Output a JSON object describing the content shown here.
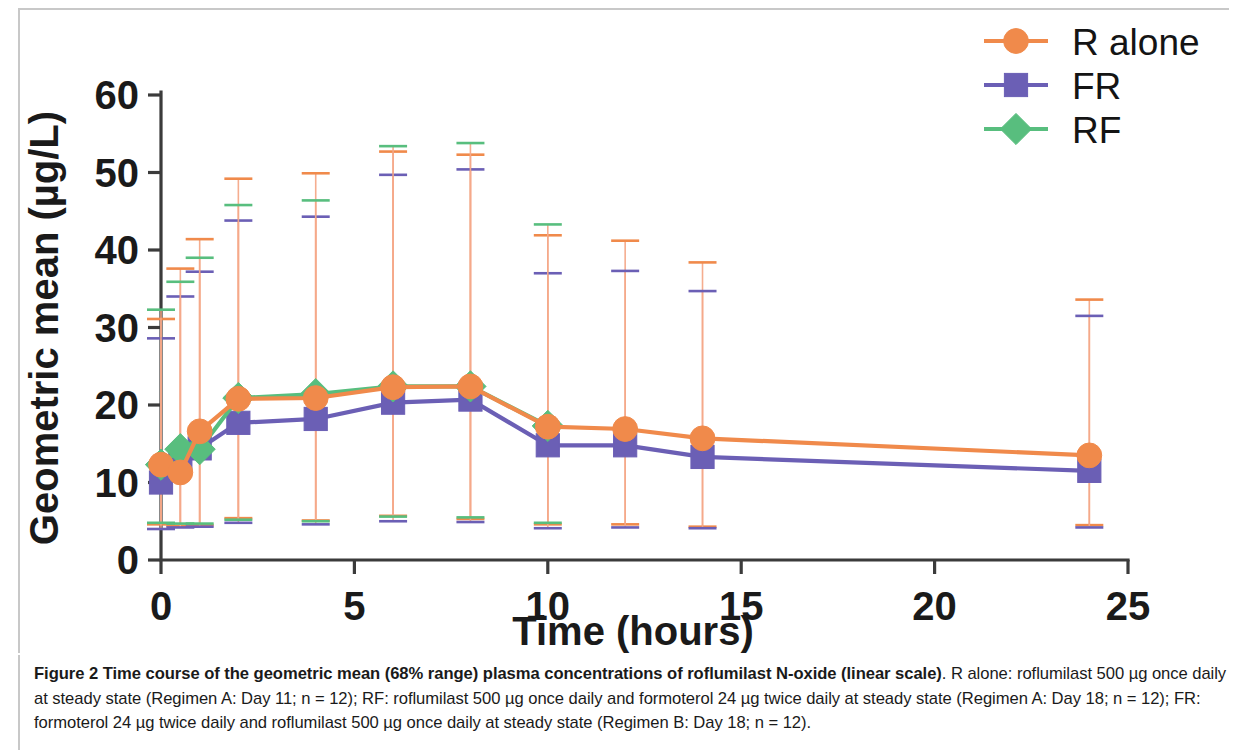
{
  "figure": {
    "caption_bold": "Figure 2 Time course of the geometric mean (68% range) plasma concentrations of roflumilast N-oxide (linear scale)",
    "caption_rest": ". R alone: roflumilast 500 µg once daily at steady state (Regimen A: Day 11; n = 12); RF: roflumilast 500 µg once daily and formoterol 24 µg twice daily at steady state (Regimen A: Day 18; n = 12); FR: formoterol 24 µg twice daily and roflumilast 500 µg once daily at steady state (Regimen B: Day 18; n = 12)."
  },
  "chart_data": {
    "type": "line",
    "title": "",
    "xlabel": "Time (hours)",
    "ylabel": "Geometric mean (µg/L)",
    "xlim": [
      0,
      25
    ],
    "ylim": [
      0,
      60
    ],
    "xticks": [
      0,
      5,
      10,
      15,
      20,
      25
    ],
    "yticks": [
      0,
      10,
      20,
      30,
      40,
      50,
      60
    ],
    "xtick_labels": [
      "0",
      "5",
      "10",
      "15",
      "20",
      "25"
    ],
    "ytick_labels": [
      "0",
      "10",
      "20",
      "30",
      "40",
      "50",
      "60"
    ],
    "grid": false,
    "legend_position": "top-right",
    "error_bars": "68% range (low/high)",
    "colors": {
      "r_alone": "#F08A4B",
      "fr": "#6B5FB5",
      "rf": "#58BE7E",
      "axis": "#3b3b3b",
      "text": "#1a1a1a",
      "frame": "#c8c8c8"
    },
    "series": [
      {
        "name": "R alone",
        "marker": "circle",
        "color": "#F08A4B",
        "x": [
          0,
          0.5,
          1,
          2,
          4,
          6,
          8,
          10,
          12,
          14,
          24
        ],
        "values": [
          12.3,
          11.3,
          16.6,
          20.8,
          20.9,
          22.3,
          22.4,
          17.2,
          16.9,
          15.7,
          13.5
        ],
        "err_low": [
          4.6,
          4.4,
          4.5,
          5.4,
          5.1,
          5.7,
          5.3,
          4.6,
          4.6,
          4.3,
          4.5
        ],
        "err_high": [
          31.1,
          37.6,
          41.4,
          49.2,
          49.9,
          52.7,
          52.3,
          41.9,
          41.2,
          38.4,
          33.6
        ]
      },
      {
        "name": "FR",
        "marker": "square",
        "color": "#6B5FB5",
        "x": [
          0,
          0.5,
          1,
          2,
          4,
          6,
          8,
          10,
          12,
          14,
          24
        ],
        "values": [
          10.0,
          12.9,
          14.4,
          17.7,
          18.2,
          20.3,
          20.7,
          14.8,
          14.8,
          13.3,
          11.5
        ],
        "err_low": [
          4.0,
          4.2,
          4.3,
          4.8,
          4.6,
          5.0,
          4.9,
          4.1,
          4.2,
          4.1,
          4.2
        ],
        "err_high": [
          28.6,
          34.0,
          37.2,
          43.8,
          44.3,
          49.7,
          50.4,
          37.0,
          37.3,
          34.7,
          31.5
        ]
      },
      {
        "name": "RF",
        "marker": "diamond",
        "color": "#58BE7E",
        "x": [
          0,
          0.5,
          1,
          2,
          4,
          6,
          8,
          10
        ],
        "values": [
          12.3,
          14.3,
          14.3,
          20.9,
          21.4,
          22.4,
          22.4,
          17.3
        ],
        "err_low": [
          4.8,
          4.7,
          4.7,
          5.2,
          5.0,
          5.6,
          5.5,
          4.8
        ],
        "err_high": [
          32.3,
          35.9,
          39.0,
          45.8,
          46.4,
          53.4,
          53.8,
          43.3
        ]
      }
    ]
  },
  "legend": {
    "items": [
      {
        "label": "R alone",
        "color": "#F08A4B",
        "marker": "circle"
      },
      {
        "label": "FR",
        "color": "#6B5FB5",
        "marker": "square"
      },
      {
        "label": "RF",
        "color": "#58BE7E",
        "marker": "diamond"
      }
    ]
  }
}
